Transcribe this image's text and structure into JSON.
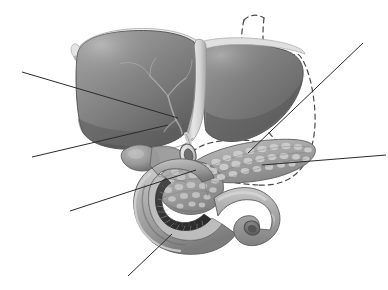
{
  "figure": {
    "style": "grayscale medical illustration",
    "background_color": "#ffffff",
    "width": 388,
    "height": 290
  },
  "palette": {
    "background": "#ffffff",
    "liver_mid": "#8a8a8a",
    "liver_dark": "#595959",
    "liver_shadow": "#4a4a4a",
    "liver_highlight": "#b4b4b4",
    "ligament_light": "#e2e2e2",
    "ligament_mid": "#c9c9c9",
    "pancreas_base": "#a8a8a8",
    "pancreas_lobule": "#cfcfcf",
    "pancreas_dark": "#7d7d7d",
    "duodenum_wall": "#a9a9a9",
    "duodenum_highlight": "#cccccc",
    "duodenum_mucosa": "#3a3a3a",
    "gallbladder": "#9c9c9c",
    "duct_ring": "#d6d6d6",
    "duct_lumen": "#6f6f6f",
    "leader_line": "#2b2b2b",
    "dashed_stomach": "#4a4a4a",
    "outline": "#4c4c4c"
  },
  "structures": [
    {
      "id": "liver-right-lobe",
      "name": "Liver, right lobe",
      "tone": "#8a8a8a",
      "note": "Large dark-gray mass occupying the upper left of the figure"
    },
    {
      "id": "liver-left-lobe",
      "name": "Liver, left lobe",
      "tone": "#7e7e7e",
      "note": "Smaller lobe to the right of the falciform ligament"
    },
    {
      "id": "falciform-ligament",
      "name": "Falciform ligament",
      "tone": "#d8d8d8",
      "note": "Pale vertical band dividing the two hepatic lobes"
    },
    {
      "id": "coronary-ligament",
      "name": "Coronary ligament / bare area rim",
      "tone": "#e2e2e2",
      "note": "Light crescent along the superior border of the liver"
    },
    {
      "id": "hepatic-veins",
      "name": "Hepatic vein branches",
      "tone": "#b9b9b9",
      "note": "Faint branching pale lines on the surface of the right lobe"
    },
    {
      "id": "gallbladder",
      "name": "Gallbladder",
      "tone": "#9c9c9c",
      "note": "Rounded fundus emerging beneath the inferior liver margin"
    },
    {
      "id": "common-bile-duct",
      "name": "Common bile duct (cut)",
      "tone": "#d6d6d6",
      "note": "Oval ring with open lumen at the porta hepatis"
    },
    {
      "id": "pancreas",
      "name": "Pancreas",
      "tone": "#a8a8a8",
      "note": "Lobulated elongated gland extending right from the duodenal loop"
    },
    {
      "id": "pancreas-head",
      "name": "Head of pancreas",
      "tone": "#a0a0a0",
      "note": "Bulbous portion cradled within the duodenal C-loop"
    },
    {
      "id": "duodenum",
      "name": "Duodenum",
      "tone": "#a9a9a9",
      "note": "C-shaped loop, opened along the inner curve"
    },
    {
      "id": "duodenal-mucosa",
      "name": "Duodenal mucosa with plicae circulares",
      "tone": "#3a3a3a",
      "note": "Dark interior band with radiating circular folds"
    },
    {
      "id": "stomach-outline",
      "name": "Stomach (outline, removed)",
      "tone": "#4a4a4a",
      "note": "Dashed contour indicating the position of the resected stomach"
    }
  ],
  "leader_lines": [
    {
      "id": "leader-1",
      "name": "leader-line-liver-right-lobe",
      "from": [
        22,
        72
      ],
      "to": [
        178,
        118
      ],
      "points_to": "liver-right-lobe"
    },
    {
      "id": "leader-2",
      "name": "leader-line-hepatic-veins",
      "from": [
        32,
        157
      ],
      "to": [
        168,
        125
      ],
      "points_to": "hepatic-veins"
    },
    {
      "id": "leader-3",
      "name": "leader-line-common-bile-duct",
      "from": [
        70,
        211
      ],
      "to": [
        196,
        170
      ],
      "points_to": "common-bile-duct"
    },
    {
      "id": "leader-4",
      "name": "leader-line-duodenum",
      "from": [
        128,
        276
      ],
      "to": [
        172,
        234
      ],
      "points_to": "duodenum"
    },
    {
      "id": "leader-5",
      "name": "leader-line-pancreas-body",
      "from": [
        363,
        43
      ],
      "to": [
        248,
        153
      ],
      "points_to": "pancreas"
    },
    {
      "id": "leader-6",
      "name": "leader-line-pancreas-tail",
      "from": [
        386,
        155
      ],
      "to": [
        262,
        165
      ],
      "points_to": "pancreas"
    }
  ],
  "labels": {
    "visible": false,
    "note": "No text labels are printed in this image; leader lines terminate at the image margins"
  }
}
